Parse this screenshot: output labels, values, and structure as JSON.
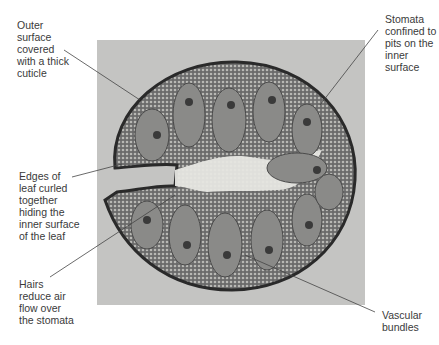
{
  "figure": {
    "colors": {
      "photo_bg": "#c4c4c2",
      "tissue_dark": "#3c3c3c",
      "tissue_mid": "#7a7a7a",
      "tissue_light": "#e8e8e4",
      "label_text": "#3a3a3a"
    }
  },
  "labels": [
    {
      "id": "cuticle",
      "text": "Outer\nsurface\ncovered\nwith a thick\ncuticle"
    },
    {
      "id": "stomata-pits",
      "text": "Stomata\nconfined to\npits on the\ninner\nsurface"
    },
    {
      "id": "curled-edges",
      "text": "Edges of\nleaf curled\ntogether\nhiding the\ninner surface\nof the leaf"
    },
    {
      "id": "hairs",
      "text": "Hairs\nreduce air\nflow over\nthe stomata"
    },
    {
      "id": "vascular",
      "text": "Vascular\nbundles"
    }
  ]
}
